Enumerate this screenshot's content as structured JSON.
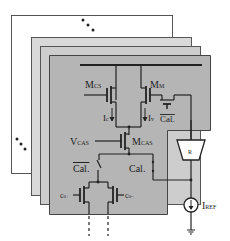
{
  "figure": {
    "type": "circuit-diagram",
    "colors": {
      "back_panel": "#ffffff",
      "panel_2": "#d9d9d9",
      "panel_3": "#cdcdcd",
      "front_panel": "#b5b5b5",
      "stroke": "#333333"
    },
    "ellipsis_top": "⋱",
    "ellipsis_left": "⋱",
    "labels": {
      "mcs": "M",
      "mcs_sub": "CS",
      "mm": "M",
      "mm_sub": "M",
      "ic": "I",
      "ic_sub": "c",
      "iv": "I",
      "iv_sub": "v",
      "cal_bar_top": "Cal.",
      "vcas": "V",
      "vcas_sub": "CAS",
      "mcas": "M",
      "mcas_sub": "CAS",
      "cal_bar_left": "Cal.",
      "cal_right": "Cal.",
      "c0_plus": "c",
      "c0_plus_sub": "0+",
      "c0_minus": "c",
      "c0_minus_sub": "0−",
      "r_block": "R",
      "iref": "I",
      "iref_sub": "REF"
    }
  }
}
